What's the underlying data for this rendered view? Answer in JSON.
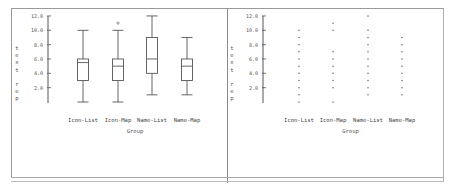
{
  "chart_data": [
    {
      "type": "box",
      "panel": "left",
      "xlabel": "Group",
      "ylabel": "text rep",
      "yticks": [
        "12.0",
        "10.0",
        "8.0",
        "6.0",
        "4.0",
        "2.0"
      ],
      "ylim": [
        0,
        12
      ],
      "categories": [
        "Icon-List",
        "Icon-Map",
        "Name-List",
        "Name-Map"
      ],
      "boxes": [
        {
          "name": "Icon-List",
          "min": 0,
          "q1": 3,
          "median": 5.5,
          "q3": 6,
          "max": 10,
          "outliers": []
        },
        {
          "name": "Icon-Map",
          "min": 0,
          "q1": 3,
          "median": 5,
          "q3": 6,
          "max": 10,
          "outliers": [
            11
          ]
        },
        {
          "name": "Name-List",
          "min": 1,
          "q1": 4,
          "median": 6,
          "q3": 9,
          "max": 12,
          "outliers": []
        },
        {
          "name": "Name-Map",
          "min": 1,
          "q1": 3,
          "median": 5,
          "q3": 6,
          "max": 9,
          "outliers": []
        }
      ],
      "grid": false,
      "legend": null
    },
    {
      "type": "scatter",
      "panel": "right",
      "xlabel": "Group",
      "ylabel": "text rep",
      "yticks": [
        "12.0",
        "10.0",
        "8.0",
        "6.0",
        "4.0",
        "2.0"
      ],
      "ylim": [
        0,
        12
      ],
      "categories": [
        "Icon-List",
        "Icon-Map",
        "Name-List",
        "Name-Map"
      ],
      "series": [
        {
          "name": "Icon-List",
          "values": [
            0,
            1,
            2,
            3,
            4,
            5,
            6,
            7,
            8,
            9,
            10
          ]
        },
        {
          "name": "Icon-Map",
          "values": [
            0,
            2,
            3,
            4,
            5,
            6,
            7,
            10,
            11
          ]
        },
        {
          "name": "Name-List",
          "values": [
            1,
            2,
            3,
            4,
            5,
            6,
            7,
            8,
            9,
            10,
            12
          ]
        },
        {
          "name": "Name-Map",
          "values": [
            1,
            2,
            3,
            4,
            5,
            6,
            7,
            8,
            9
          ]
        }
      ],
      "grid": false,
      "legend": null
    }
  ],
  "labels": {
    "xlabel": "Group",
    "ylabel_letters": [
      "t",
      "e",
      "x",
      "t",
      "",
      "r",
      "e",
      "p"
    ],
    "categories": [
      "Icon-List",
      "Icon-Map",
      "Name-List",
      "Name-Map"
    ],
    "yticks": [
      "12.0",
      "10.0",
      "8.0",
      "6.0",
      "4.0",
      "2.0"
    ]
  },
  "colors": {
    "line": "#555555",
    "frame": "#9a9a9a",
    "background": "#ffffff"
  }
}
